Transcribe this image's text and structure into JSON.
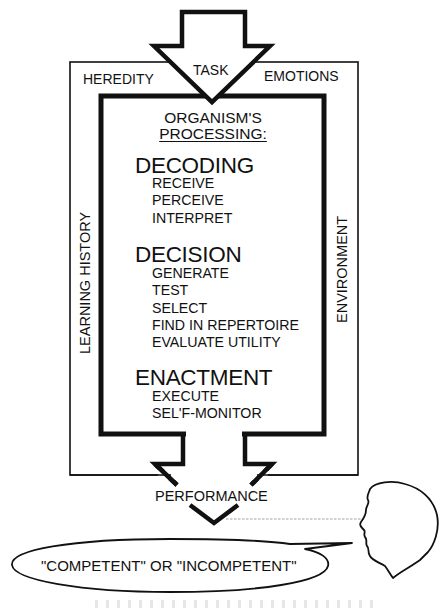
{
  "diagram": {
    "input_arrow": {
      "label": "TASK"
    },
    "context_factors": {
      "top_left": "HEREDITY",
      "top_right": "EMOTIONS",
      "left": "LEARNING HISTORY",
      "right": "ENVIRONMENT"
    },
    "processing_box": {
      "title_line1": "ORGANISM'S",
      "title_line2": "PROCESSING:",
      "stages": [
        {
          "name": "DECODING",
          "steps": [
            "RECEIVE",
            "PERCEIVE",
            "INTERPRET"
          ]
        },
        {
          "name": "DECISION",
          "steps": [
            "GENERATE",
            "TEST",
            "SELECT",
            "FIND IN REPERTOIRE",
            "EVALUATE UTILITY"
          ]
        },
        {
          "name": "ENACTMENT",
          "steps": [
            "EXECUTE",
            "SEL'F-MONITOR"
          ]
        }
      ]
    },
    "output_arrow": {
      "label": "PERFORMANCE"
    },
    "observer": {
      "icon": "human-head-profile-icon",
      "judgment": "\"COMPETENT\" OR \"INCOMPETENT\""
    },
    "colors": {
      "stroke": "#111111",
      "background": "#ffffff",
      "dashed_line": "#8a8a8a"
    }
  }
}
